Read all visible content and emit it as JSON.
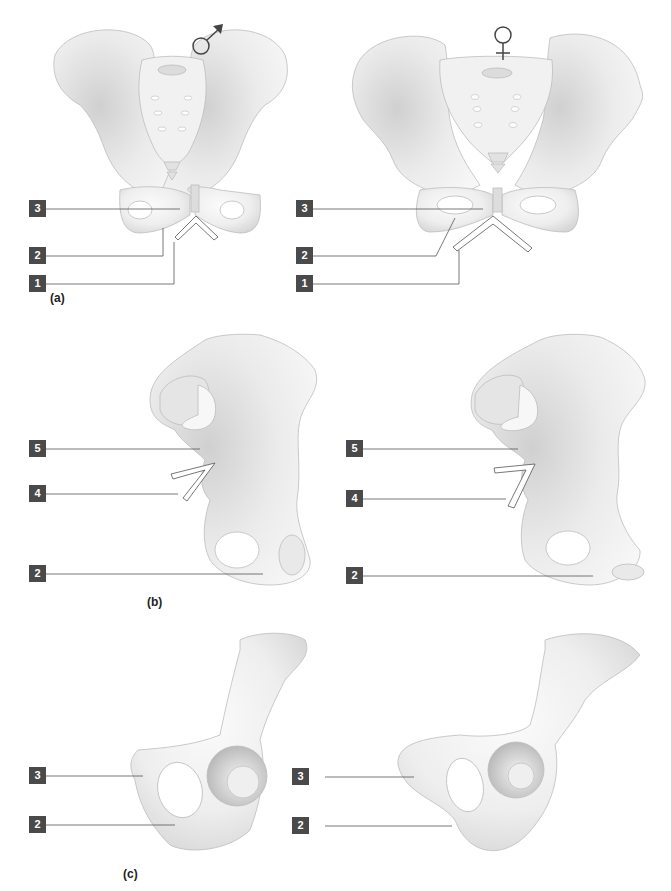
{
  "figure": {
    "parts": [
      {
        "id": "a",
        "caption": "(a)",
        "panels": [
          {
            "sex_symbol": "male",
            "labels": [
              "3",
              "2",
              "1"
            ]
          },
          {
            "sex_symbol": "female",
            "labels": [
              "3",
              "2",
              "1"
            ]
          }
        ]
      },
      {
        "id": "b",
        "caption": "(b)",
        "panels": [
          {
            "labels": [
              "5",
              "4",
              "2"
            ]
          },
          {
            "labels": [
              "5",
              "4",
              "2"
            ]
          }
        ]
      },
      {
        "id": "c",
        "caption": "(c)",
        "panels": [
          {
            "labels": [
              "3",
              "2"
            ]
          },
          {
            "labels": [
              "3",
              "2"
            ]
          }
        ]
      }
    ],
    "icons": {
      "male": "male-symbol-icon",
      "female": "female-symbol-icon"
    },
    "colors": {
      "label_box": "#4a4a4a",
      "label_text": "#ffffff",
      "leader_line": "#555555",
      "bone_fill": "#f2f2f2",
      "bone_shade": "#cfcfcf",
      "angle_marker": "#ffffff"
    }
  }
}
